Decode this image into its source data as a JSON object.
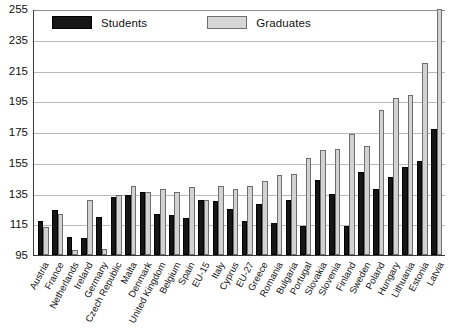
{
  "chart_data": {
    "type": "bar",
    "title": "",
    "subtitle": "",
    "xlabel": "",
    "ylabel": "",
    "ylim": [
      95,
      255
    ],
    "yticks": [
      95,
      115,
      135,
      155,
      175,
      195,
      215,
      235,
      255
    ],
    "grid": true,
    "legend_position": "top-left",
    "categories": [
      "Austria",
      "France",
      "Netherlands",
      "Ireland",
      "Germany",
      "Czech Republic",
      "Malta",
      "Denmark",
      "United Kingdom",
      "Belgium",
      "Spain",
      "EU-15",
      "Italy",
      "Cyprus",
      "EU-27",
      "Greece",
      "Romania",
      "Bulgaria",
      "Portugal",
      "Slovakia",
      "Slovenia",
      "Finland",
      "Sweden",
      "Poland",
      "Hungary",
      "Lithuania",
      "Estonia",
      "Latvia"
    ],
    "series": [
      {
        "name": "Students",
        "color": "#161616",
        "values": [
          117,
          124,
          107,
          106,
          120,
          133,
          134,
          136,
          122,
          121,
          119,
          131,
          130,
          125,
          117,
          128,
          116,
          131,
          114,
          144,
          135,
          114,
          149,
          138,
          146,
          152,
          156,
          177
        ]
      },
      {
        "name": "Graduates",
        "color": "#d2d2d2",
        "values": [
          113,
          122,
          98,
          131,
          99,
          134,
          140,
          136,
          138,
          136,
          139,
          131,
          140,
          138,
          140,
          143,
          147,
          148,
          158,
          163,
          164,
          174,
          166,
          189,
          197,
          199,
          220,
          256
        ]
      }
    ]
  },
  "legend": {
    "entries": [
      {
        "label": "Students"
      },
      {
        "label": "Graduates"
      }
    ]
  }
}
